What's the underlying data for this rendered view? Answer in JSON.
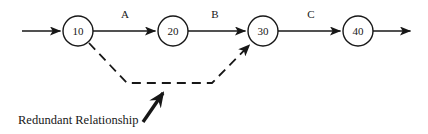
{
  "diagram": {
    "background_color": "#ffffff",
    "line_color": "#171717",
    "nodes": [
      {
        "id": "node-10",
        "label": "10",
        "cx": 78,
        "cy": 31,
        "r": 15
      },
      {
        "id": "node-20",
        "label": "20",
        "cx": 173,
        "cy": 31,
        "r": 15
      },
      {
        "id": "node-30",
        "label": "30",
        "cx": 263,
        "cy": 31,
        "r": 15
      },
      {
        "id": "node-40",
        "label": "40",
        "cx": 358,
        "cy": 31,
        "r": 15
      }
    ],
    "edges": [
      {
        "id": "edge-entry",
        "label": "",
        "style": "solid",
        "from": "start",
        "to": "node-10"
      },
      {
        "id": "edge-a",
        "label": "A",
        "style": "solid",
        "from": "node-10",
        "to": "node-20",
        "label_x": 125,
        "label_y": 18
      },
      {
        "id": "edge-b",
        "label": "B",
        "style": "solid",
        "from": "node-20",
        "to": "node-30",
        "label_x": 215,
        "label_y": 18
      },
      {
        "id": "edge-c",
        "label": "C",
        "style": "solid",
        "from": "node-30",
        "to": "node-40",
        "label_x": 311,
        "label_y": 18
      },
      {
        "id": "edge-exit",
        "label": "",
        "style": "solid",
        "from": "node-40",
        "to": "end"
      },
      {
        "id": "edge-redundant",
        "label": "",
        "style": "dashed",
        "from": "node-10",
        "to": "node-30"
      }
    ],
    "annotation": {
      "text": "Redundant Relationship",
      "text_x": 18,
      "text_y": 124,
      "pointer": {
        "from_x": 143,
        "from_y": 122,
        "to_x": 167,
        "to_y": 88
      }
    }
  }
}
